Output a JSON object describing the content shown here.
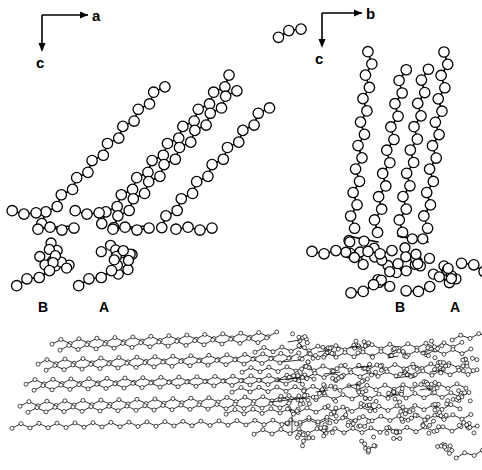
{
  "figure": {
    "background_color": "#ffffff",
    "line_color": "#000000",
    "atom_fill_color": "#ffffff",
    "width": 482,
    "height": 470
  },
  "panels": [
    {
      "id": "panel-left",
      "name": "projection-along-b",
      "axes": {
        "horizontal": {
          "label": "a",
          "direction": "right"
        },
        "vertical": {
          "label": "c",
          "direction": "down"
        }
      },
      "molecule_labels": [
        {
          "label": "B",
          "x": 44,
          "y": 312
        },
        {
          "label": "A",
          "x": 105,
          "y": 312
        }
      ]
    },
    {
      "id": "panel-right",
      "name": "projection-along-a",
      "axes": {
        "horizontal": {
          "label": "b",
          "direction": "right"
        },
        "vertical": {
          "label": "c",
          "direction": "down"
        }
      },
      "molecule_labels": [
        {
          "label": "B",
          "x": 401,
          "y": 312
        },
        {
          "label": "A",
          "x": 456,
          "y": 312
        }
      ]
    },
    {
      "id": "panel-bottom",
      "name": "bilayer-packing-overview",
      "axes": null,
      "molecule_labels": []
    }
  ],
  "chart_data": {
    "type": "scatter",
    "xlabel": "",
    "ylabel": "",
    "subplots": [
      {
        "name": "projection-along-b",
        "axis_x": "a",
        "axis_y": "c",
        "chain_tilt_deg": 42,
        "chains": 4,
        "molecules": [
          "B",
          "A"
        ],
        "representation": "ball-and-stick"
      },
      {
        "name": "projection-along-a",
        "axis_x": "b",
        "axis_y": "c",
        "chain_tilt_deg": 8,
        "chains": 4,
        "molecules": [
          "B",
          "A"
        ],
        "representation": "ball-and-stick"
      },
      {
        "name": "bilayer-packing-overview",
        "axis_x": "",
        "axis_y": "",
        "chain_tilt_deg": 4,
        "chains": 10,
        "molecules": [],
        "representation": "ball-and-stick-small"
      }
    ]
  }
}
